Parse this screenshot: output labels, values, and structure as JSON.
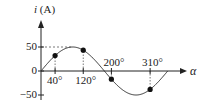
{
  "chart_data": {
    "type": "line",
    "title": "",
    "function": "i = 50 sin(alpha)",
    "xlabel": "α",
    "ylabel": "i (A)",
    "ylabel_var": "i",
    "ylabel_unit": "(A)",
    "xlim": [
      0,
      360
    ],
    "ylim": [
      -50,
      50
    ],
    "y_ticks": [
      {
        "value": 50,
        "label": "50"
      },
      {
        "value": 0,
        "label": "0"
      },
      {
        "value": -50,
        "label": "−50"
      }
    ],
    "x_ticks": [
      {
        "value": 40,
        "label": "40°",
        "position": "below"
      },
      {
        "value": 120,
        "label": "120°",
        "position": "below"
      },
      {
        "value": 200,
        "label": "200°",
        "position": "above"
      },
      {
        "value": 310,
        "label": "310°",
        "position": "above"
      }
    ],
    "series": [
      {
        "name": "i(α)",
        "amplitude": 50,
        "x": [
          0,
          30,
          60,
          90,
          120,
          150,
          180,
          210,
          240,
          270,
          300,
          330,
          360
        ],
        "values": [
          0,
          25,
          43.3,
          50,
          43.3,
          25,
          0,
          -25,
          -43.3,
          -50,
          -43.3,
          -25,
          0
        ]
      }
    ],
    "marked_points": [
      {
        "alpha": 40,
        "i": 32.1
      },
      {
        "alpha": 120,
        "i": 43.3
      },
      {
        "alpha": 200,
        "i": -17.1
      },
      {
        "alpha": 310,
        "i": -38.3
      }
    ],
    "peak_guide": {
      "value": 50,
      "dashed": true
    },
    "grid": false,
    "legend": null
  },
  "colors": {
    "axis": "#222222",
    "curve": "#333333",
    "point": "#111111",
    "guide": "#555555"
  }
}
